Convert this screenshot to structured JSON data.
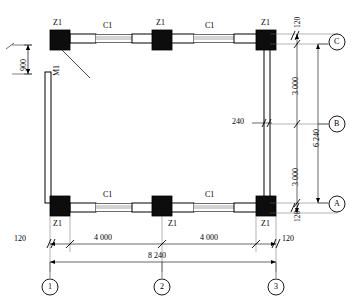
{
  "drawing": {
    "type": "structural-floor-plan",
    "title": "",
    "units": "mm"
  },
  "members": {
    "column_tag": "Z1",
    "beam_tag": "C1",
    "wall_tag": "M1"
  },
  "columns": [
    {
      "tag": "Z1",
      "grid": "1/C"
    },
    {
      "tag": "Z1",
      "grid": "2/C"
    },
    {
      "tag": "Z1",
      "grid": "3/C"
    },
    {
      "tag": "Z1",
      "grid": "1/A"
    },
    {
      "tag": "Z1",
      "grid": "2/A"
    },
    {
      "tag": "Z1",
      "grid": "3/A"
    }
  ],
  "beams": [
    {
      "tag": "C1",
      "location": "top-left"
    },
    {
      "tag": "C1",
      "location": "top-right"
    },
    {
      "tag": "C1",
      "location": "bottom-left"
    },
    {
      "tag": "C1",
      "location": "bottom-right"
    }
  ],
  "walls": [
    {
      "tag": "M1",
      "location": "left"
    }
  ],
  "grid_labels": {
    "horizontal": [
      "1",
      "2",
      "3"
    ],
    "vertical": [
      "A",
      "B",
      "C"
    ]
  },
  "dimensions": {
    "bottom_chain_1": [
      "4 000",
      "4 000"
    ],
    "bottom_chain_2": [
      "8 240"
    ],
    "bottom_edge_left": "120",
    "bottom_edge_right": "120",
    "right_chain_1": [
      "3 000",
      "3 000"
    ],
    "right_chain_2": [
      "6 240"
    ],
    "right_edge_top": "120",
    "right_edge_bottom": "120",
    "left_offset": "900",
    "wall_thickness": "240"
  },
  "annotations": {
    "z1_top_left": "Z1",
    "z1_top_mid": "Z1",
    "z1_top_right": "Z1",
    "z1_bot_left": "Z1",
    "z1_bot_mid": "Z1",
    "z1_bot_right": "Z1",
    "c1_top_left": "C1",
    "c1_top_right": "C1",
    "c1_bot_left": "C1",
    "c1_bot_right": "C1",
    "m1_left_wall": "M1",
    "dim_900": "900",
    "dim_240": "240",
    "dim_120_tr": "120",
    "dim_120_br_inner": "120",
    "dim_120_bottom_right": "120",
    "dim_120_bottom_left": "120",
    "dim_3000_upper": "3 000",
    "dim_3000_lower": "3 000",
    "dim_6240": "6 240",
    "dim_4000_left": "4 000",
    "dim_4000_right": "4 000",
    "dim_8240": "8 240",
    "grid_1": "1",
    "grid_2": "2",
    "grid_3": "3",
    "grid_A": "A",
    "grid_B": "B",
    "grid_C": "C"
  },
  "colors": {
    "ink": "#000000",
    "paper": "#ffffff",
    "column_fill": "#0d0d0d",
    "beam_fill": "#ffffff",
    "thin_line": "#4d4d4d"
  }
}
